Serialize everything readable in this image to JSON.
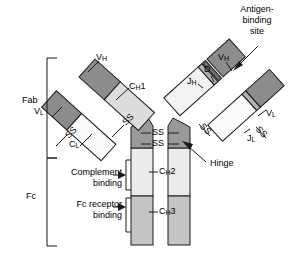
{
  "figure": {
    "type": "diagram",
    "width": 302,
    "height": 260,
    "background": "#ffffff"
  },
  "colors": {
    "variable_domain": "#8c8c8c",
    "constant_light": "#f2f2f2",
    "ch1_domain": "#dcdcdc",
    "ch2_domain": "#ebebeb",
    "ch3_domain": "#c4c4c4",
    "hinge": "#9a9a9a",
    "junction_band": "#b0b0b0",
    "outline": "#1a1a1a",
    "text": "#000000"
  },
  "region_brackets": [
    {
      "name": "Fab",
      "label": "Fab",
      "label_x": 24,
      "label_y": 100,
      "top": 58,
      "bottom": 158,
      "x": 47
    },
    {
      "name": "Fc",
      "label": "Fc",
      "label_x": 28,
      "label_y": 196,
      "top": 158,
      "bottom": 246,
      "x": 47
    }
  ],
  "domain_labels": [
    {
      "name": "v-heavy-left",
      "text": "V",
      "subscript": "H",
      "x": 96,
      "y": 57
    },
    {
      "name": "ch1-left",
      "text": "C",
      "subscript": "H",
      "suffix": "1",
      "x": 129,
      "y": 86
    },
    {
      "name": "v-light-left",
      "text": "V",
      "subscript": "L",
      "x": 36,
      "y": 110
    },
    {
      "name": "c-light-left",
      "text": "C",
      "subscript": "L",
      "x": 71,
      "y": 143
    },
    {
      "name": "v-heavy-right",
      "text": "V",
      "subscript": "H",
      "x": 220,
      "y": 57
    },
    {
      "name": "d-segment",
      "text": "D",
      "x": 207,
      "y": 69
    },
    {
      "name": "j-heavy",
      "text": "J",
      "subscript": "H",
      "x": 190,
      "y": 80
    },
    {
      "name": "v-light-right",
      "text": "V",
      "subscript": "L",
      "x": 268,
      "y": 112
    },
    {
      "name": "j-light",
      "text": "J",
      "subscript": "L",
      "x": 249,
      "y": 137
    },
    {
      "name": "ch2",
      "text": "C",
      "subscript": "H",
      "suffix": "2",
      "x": 159,
      "y": 176
    },
    {
      "name": "ch3",
      "text": "C",
      "subscript": "H",
      "suffix": "3",
      "x": 159,
      "y": 216
    }
  ],
  "disulfide_labels": [
    {
      "name": "ss-interheavy-upper",
      "text": "SS",
      "x": 153,
      "y": 130
    },
    {
      "name": "ss-interheavy-lower",
      "text": "SS",
      "x": 153,
      "y": 141
    },
    {
      "name": "ss-left-inner",
      "text": "SS",
      "x": 122,
      "y": 123,
      "rotate": -45
    },
    {
      "name": "ss-left-outer",
      "text": "SS",
      "x": 63,
      "y": 136,
      "rotate": -45
    },
    {
      "name": "ss-right-inner",
      "text": "SS",
      "x": 206,
      "y": 122,
      "rotate": 45
    },
    {
      "name": "ss-right-outer",
      "text": "SS",
      "x": 262,
      "y": 126,
      "rotate": 45
    }
  ],
  "callouts": [
    {
      "name": "antigen-binding-site",
      "text": "Antigen-\nbinding\nsite",
      "x": 228,
      "y": 4,
      "arrow": {
        "from_x": 256,
        "from_y": 48,
        "to_x": 235,
        "to_y": 68
      }
    },
    {
      "name": "complement-binding",
      "text": "Complement\nbinding",
      "x": 52,
      "y": 168,
      "arrow": {
        "from_x": 124,
        "from_y": 174,
        "to_x": 143,
        "to_y": 174
      }
    },
    {
      "name": "fc-receptor-binding",
      "text": "Fc receptor\nbinding",
      "x": 58,
      "y": 198,
      "arrow": {
        "from_x": 124,
        "from_y": 205,
        "to_x": 143,
        "to_y": 205
      }
    },
    {
      "name": "hinge",
      "text": "Hinge",
      "x": 208,
      "y": 161,
      "arrow": {
        "from_x": 206,
        "from_y": 160,
        "to_x": 184,
        "to_y": 143
      }
    }
  ]
}
